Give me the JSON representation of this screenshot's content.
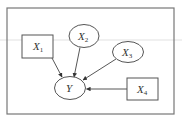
{
  "diagram": {
    "type": "directed-graph",
    "frame": {
      "x": 7,
      "y": 8,
      "width": 167,
      "height": 106
    },
    "nodes": [
      {
        "id": "X1",
        "label": "X",
        "sub": "1",
        "shape": "rect",
        "x": 22,
        "y": 35,
        "w": 31,
        "h": 23
      },
      {
        "id": "X2",
        "label": "X",
        "sub": "2",
        "shape": "ellipse",
        "cx": 84,
        "cy": 36,
        "rx": 15,
        "ry": 11.5
      },
      {
        "id": "X3",
        "label": "X",
        "sub": "3",
        "shape": "ellipse",
        "cx": 128,
        "cy": 52,
        "rx": 15.5,
        "ry": 10.5
      },
      {
        "id": "Y",
        "label": "Y",
        "sub": "",
        "shape": "ellipse",
        "cx": 70,
        "cy": 88,
        "rx": 15.5,
        "ry": 11.5
      },
      {
        "id": "X4",
        "label": "X",
        "sub": "4",
        "shape": "rect",
        "x": 127,
        "y": 78,
        "w": 31,
        "h": 22
      }
    ],
    "edges": [
      {
        "from": "X1",
        "to": "Y"
      },
      {
        "from": "X2",
        "to": "Y"
      },
      {
        "from": "X3",
        "to": "Y"
      },
      {
        "from": "X4",
        "to": "Y"
      }
    ]
  }
}
